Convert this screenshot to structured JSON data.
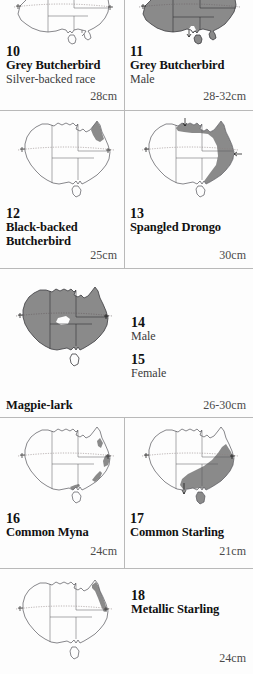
{
  "plate": {
    "background_color": "#fdfdfd",
    "rule_color": "#b9b9b9",
    "map_outline_color": "#55555a",
    "map_shade_color": "#8a8a8a",
    "map_border_color": "#444448",
    "tropic_line_color": "#8b7f7f"
  },
  "entries": [
    {
      "number": "10",
      "name": "Grey Butcherbird",
      "subtitle": "Silver-backed race",
      "size": "28cm",
      "map": "australia-range-map-10"
    },
    {
      "number": "11",
      "name": "Grey Butcherbird",
      "subtitle": "Male",
      "size": "28-32cm",
      "map": "australia-range-map-11"
    },
    {
      "number": "12",
      "name": "Black-backed Butcherbird",
      "name_line1": "Black-backed",
      "name_line2": "Butcherbird",
      "subtitle": "",
      "size": "25cm",
      "map": "australia-range-map-12"
    },
    {
      "number": "13",
      "name": "Spangled Drongo",
      "subtitle": "",
      "size": "30cm",
      "map": "australia-range-map-13"
    },
    {
      "number": "14",
      "name": "",
      "subtitle": "Male",
      "size": "",
      "map": ""
    },
    {
      "number": "15",
      "name": "",
      "subtitle": "Female",
      "size": "",
      "map": ""
    },
    {
      "number": "16",
      "name": "Common Myna",
      "subtitle": "",
      "size": "24cm",
      "map": "australia-range-map-16"
    },
    {
      "number": "17",
      "name": "Common Starling",
      "subtitle": "",
      "size": "21cm",
      "map": "australia-range-map-17"
    },
    {
      "number": "18",
      "name": "Metallic Starling",
      "subtitle": "",
      "size": "24cm",
      "map": "australia-range-map-18"
    }
  ],
  "magpie_lark": {
    "name": "Magpie-lark",
    "size": "26-30cm",
    "map": "australia-range-map-magpie-lark"
  }
}
